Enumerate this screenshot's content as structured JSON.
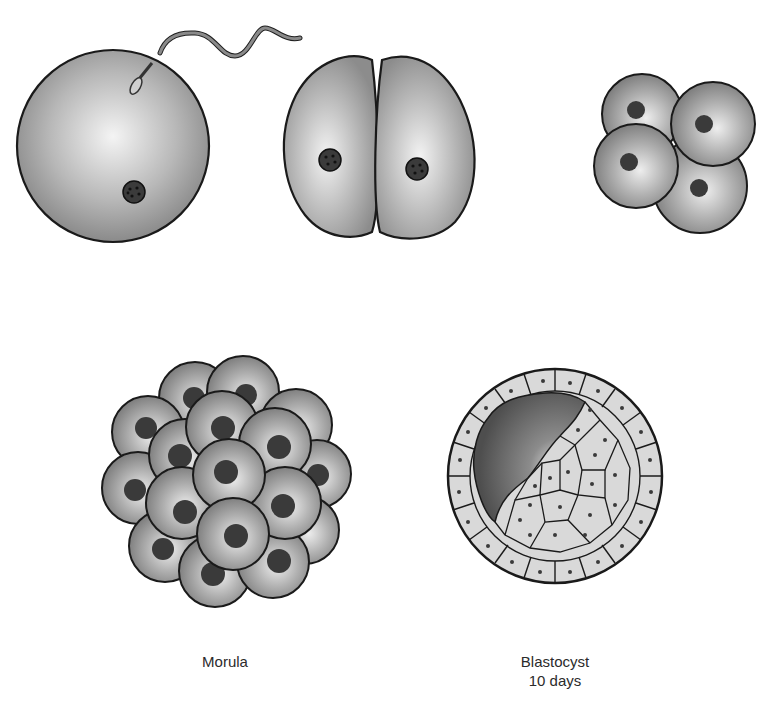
{
  "diagram": {
    "type": "embryo-development-stages",
    "colors": {
      "outline": "#1a1a1a",
      "cell_light": "#f2f2f2",
      "cell_mid": "#bdbdbd",
      "cell_dark": "#8e8e8e",
      "nucleus": "#3a3a3a",
      "blastocoel_dark": "#555555",
      "blastocyst_cell": "#d9d9d9",
      "background": "#ffffff"
    },
    "stages": [
      {
        "id": "fertilization",
        "label": "",
        "description": "Egg with sperm"
      },
      {
        "id": "two-cell",
        "label": "",
        "description": "Two-cell stage"
      },
      {
        "id": "four-cell",
        "label": "",
        "description": "Four-cell stage"
      },
      {
        "id": "morula",
        "label": "Morula",
        "description": "Solid ball of cells"
      },
      {
        "id": "blastocyst",
        "label": "Blastocyst",
        "sublabel": "10 days",
        "description": "Hollow ball with inner cell mass"
      }
    ]
  }
}
